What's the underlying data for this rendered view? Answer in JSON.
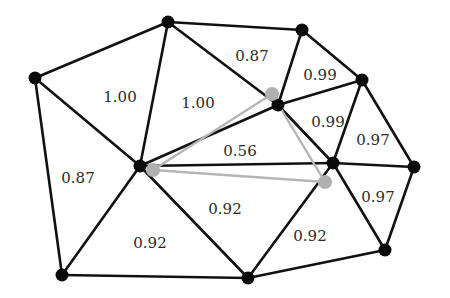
{
  "diagram": {
    "type": "triangulation-mesh",
    "colors": {
      "edge": "#111111",
      "vertex": "#0a0a0a",
      "highlight_edge": "#b5b5b5",
      "highlight_vertex": "#b0b0b0",
      "label": "#2a2a2a",
      "background": "#ffffff"
    },
    "vertices": [
      {
        "id": "A",
        "x": 35,
        "y": 78
      },
      {
        "id": "B",
        "x": 168,
        "y": 22
      },
      {
        "id": "C",
        "x": 302,
        "y": 30
      },
      {
        "id": "D",
        "x": 362,
        "y": 80
      },
      {
        "id": "E",
        "x": 278,
        "y": 105
      },
      {
        "id": "F",
        "x": 140,
        "y": 166
      },
      {
        "id": "G",
        "x": 333,
        "y": 163
      },
      {
        "id": "H",
        "x": 414,
        "y": 167
      },
      {
        "id": "I",
        "x": 385,
        "y": 250
      },
      {
        "id": "J",
        "x": 248,
        "y": 278
      },
      {
        "id": "K",
        "x": 62,
        "y": 275
      }
    ],
    "edges": [
      [
        "A",
        "B"
      ],
      [
        "A",
        "F"
      ],
      [
        "A",
        "K"
      ],
      [
        "B",
        "C"
      ],
      [
        "B",
        "F"
      ],
      [
        "B",
        "E"
      ],
      [
        "C",
        "E"
      ],
      [
        "C",
        "D"
      ],
      [
        "D",
        "E"
      ],
      [
        "D",
        "G"
      ],
      [
        "D",
        "H"
      ],
      [
        "E",
        "F"
      ],
      [
        "E",
        "G"
      ],
      [
        "F",
        "G"
      ],
      [
        "F",
        "K"
      ],
      [
        "F",
        "J"
      ],
      [
        "G",
        "H"
      ],
      [
        "G",
        "I"
      ],
      [
        "G",
        "J"
      ],
      [
        "H",
        "I"
      ],
      [
        "I",
        "J"
      ],
      [
        "J",
        "K"
      ]
    ],
    "highlight_vertices": [
      {
        "id": "P1",
        "x": 272,
        "y": 94
      },
      {
        "id": "P2",
        "x": 153,
        "y": 170
      },
      {
        "id": "P3",
        "x": 325,
        "y": 182
      }
    ],
    "highlight_edges": [
      [
        "P1",
        "P2"
      ],
      [
        "P2",
        "P3"
      ],
      [
        "P3",
        "P1"
      ]
    ],
    "labels": [
      {
        "text": "1.00",
        "x": 120,
        "y": 98,
        "face": "A-B-F"
      },
      {
        "text": "1.00",
        "x": 198,
        "y": 104,
        "face": "B-E-F"
      },
      {
        "text": "0.87",
        "x": 252,
        "y": 57,
        "face": "B-C-E"
      },
      {
        "text": "0.99",
        "x": 320,
        "y": 76,
        "face": "C-D-E"
      },
      {
        "text": "0.99",
        "x": 328,
        "y": 123,
        "face": "D-E-G"
      },
      {
        "text": "0.97",
        "x": 373,
        "y": 141,
        "face": "D-G-H"
      },
      {
        "text": "0.56",
        "x": 240,
        "y": 152,
        "face": "E-F-G"
      },
      {
        "text": "0.87",
        "x": 78,
        "y": 179,
        "face": "A-F-K"
      },
      {
        "text": "0.92",
        "x": 225,
        "y": 210,
        "face": "F-G-J"
      },
      {
        "text": "0.97",
        "x": 378,
        "y": 198,
        "face": "G-H-I"
      },
      {
        "text": "0.92",
        "x": 310,
        "y": 237,
        "face": "G-I-J"
      },
      {
        "text": "0.92",
        "x": 150,
        "y": 244,
        "face": "F-J-K"
      }
    ]
  }
}
